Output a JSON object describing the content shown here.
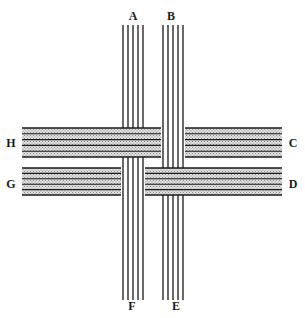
{
  "diagram": {
    "type": "weave",
    "colors": {
      "ink": "#1a1a1a",
      "band_fill": "#c8c8c8",
      "background": "#ffffff"
    },
    "labels": {
      "A": {
        "text": "A",
        "x": 133,
        "y": 16
      },
      "B": {
        "text": "B",
        "x": 171,
        "y": 16
      },
      "C": {
        "text": "C",
        "x": 293,
        "y": 143
      },
      "D": {
        "text": "D",
        "x": 293,
        "y": 184
      },
      "E": {
        "text": "E",
        "x": 176,
        "y": 306
      },
      "F": {
        "text": "F",
        "x": 132,
        "y": 306
      },
      "G": {
        "text": "G",
        "x": 11,
        "y": 184
      },
      "H": {
        "text": "H",
        "x": 11,
        "y": 143
      }
    },
    "vertical_groups": [
      {
        "name": "A-F",
        "top_label": "A",
        "bottom_label": "F",
        "strand_x": [
          123,
          128,
          133,
          138,
          143
        ],
        "y_start": 25,
        "y_end": 300
      },
      {
        "name": "B-E",
        "top_label": "B",
        "bottom_label": "E",
        "strand_x": [
          163,
          168,
          173,
          178,
          183
        ],
        "y_start": 25,
        "y_end": 300
      }
    ],
    "horizontal_bands": [
      {
        "name": "H-C",
        "left_label": "H",
        "right_label": "C",
        "y_top": 128,
        "y_bottom": 157,
        "x_start": 22,
        "x_end": 282,
        "over": "A-F",
        "under": "B-E"
      },
      {
        "name": "G-D",
        "left_label": "G",
        "right_label": "D",
        "y_top": 168,
        "y_bottom": 195,
        "x_start": 22,
        "x_end": 282,
        "over": "B-E",
        "under": "A-F"
      }
    ]
  }
}
